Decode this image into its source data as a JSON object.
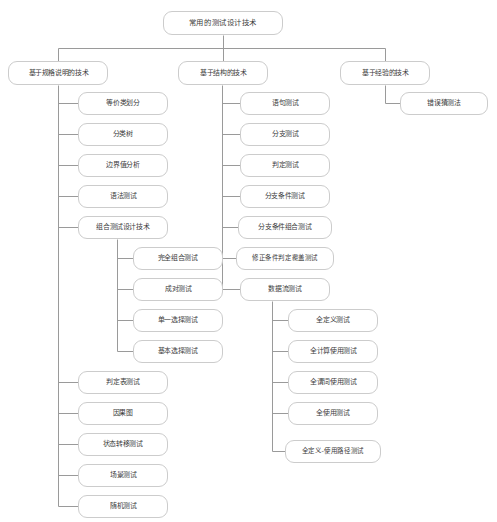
{
  "diagram": {
    "type": "tree-mindmap",
    "title": "常用的测试设计技术",
    "theme": {
      "background": "#ffffff",
      "node_fill": "#ffffff",
      "node_border": "#cccccc",
      "edge_color": "#9a9a9a",
      "text_color": "#3b3b3b"
    }
  },
  "nodes": {
    "root": {
      "label": "常用的测试设计技术",
      "x": 163,
      "y": 11,
      "w": 120,
      "h": 24,
      "fs": 8
    },
    "spec": {
      "label": "基于规格说明的技术",
      "x": 8,
      "y": 61,
      "w": 100,
      "h": 24,
      "fs": 7.5
    },
    "struct": {
      "label": "基于结构的技术",
      "x": 178,
      "y": 61,
      "w": 90,
      "h": 24,
      "fs": 7.5
    },
    "exp": {
      "label": "基于经验的技术",
      "x": 340,
      "y": 61,
      "w": 90,
      "h": 24,
      "fs": 7.5
    },
    "exp1": {
      "label": "错误猜测法",
      "x": 400,
      "y": 92,
      "w": 88,
      "h": 23,
      "fs": 7.5
    },
    "s1": {
      "label": "等价类划分",
      "x": 78,
      "y": 92,
      "w": 90,
      "h": 23,
      "fs": 7.5
    },
    "s2": {
      "label": "分类树",
      "x": 78,
      "y": 123,
      "w": 90,
      "h": 23,
      "fs": 7.5
    },
    "s3": {
      "label": "边界值分析",
      "x": 78,
      "y": 154,
      "w": 90,
      "h": 23,
      "fs": 7.5
    },
    "s4": {
      "label": "语法测试",
      "x": 78,
      "y": 185,
      "w": 90,
      "h": 23,
      "fs": 7.5
    },
    "s5": {
      "label": "组合测试设计技术",
      "x": 78,
      "y": 216,
      "w": 90,
      "h": 23,
      "fs": 7.5
    },
    "c1": {
      "label": "完全组合测试",
      "x": 133,
      "y": 247,
      "w": 90,
      "h": 23,
      "fs": 7.5
    },
    "c2": {
      "label": "成对测试",
      "x": 133,
      "y": 278,
      "w": 90,
      "h": 23,
      "fs": 7.5
    },
    "c3": {
      "label": "单一选择测试",
      "x": 133,
      "y": 309,
      "w": 90,
      "h": 23,
      "fs": 7.5
    },
    "c4": {
      "label": "基本选择测试",
      "x": 133,
      "y": 340,
      "w": 90,
      "h": 23,
      "fs": 7.5
    },
    "s6": {
      "label": "判定表测试",
      "x": 78,
      "y": 371,
      "w": 90,
      "h": 23,
      "fs": 7.5
    },
    "s7": {
      "label": "因果图",
      "x": 78,
      "y": 402,
      "w": 90,
      "h": 23,
      "fs": 7.5
    },
    "s8": {
      "label": "状态转移测试",
      "x": 78,
      "y": 433,
      "w": 90,
      "h": 23,
      "fs": 7.5
    },
    "s9": {
      "label": "场景测试",
      "x": 78,
      "y": 464,
      "w": 90,
      "h": 23,
      "fs": 7.5
    },
    "s10": {
      "label": "随机测试",
      "x": 78,
      "y": 495,
      "w": 90,
      "h": 23,
      "fs": 7.5
    },
    "t1": {
      "label": "语句测试",
      "x": 240,
      "y": 92,
      "w": 90,
      "h": 23,
      "fs": 7.5
    },
    "t2": {
      "label": "分支测试",
      "x": 240,
      "y": 123,
      "w": 90,
      "h": 23,
      "fs": 7.5
    },
    "t3": {
      "label": "判定测试",
      "x": 240,
      "y": 154,
      "w": 90,
      "h": 23,
      "fs": 7.5
    },
    "t4": {
      "label": "分支条件测试",
      "x": 240,
      "y": 185,
      "w": 90,
      "h": 23,
      "fs": 7.5
    },
    "t5": {
      "label": "分支条件组合测试",
      "x": 238,
      "y": 216,
      "w": 94,
      "h": 23,
      "fs": 7.5
    },
    "t6": {
      "label": "修正条件判定覆盖测试",
      "x": 236,
      "y": 247,
      "w": 98,
      "h": 23,
      "fs": 7
    },
    "t7": {
      "label": "数据流测试",
      "x": 240,
      "y": 278,
      "w": 90,
      "h": 23,
      "fs": 7.5
    },
    "d1": {
      "label": "全定义测试",
      "x": 288,
      "y": 309,
      "w": 90,
      "h": 23,
      "fs": 7.5
    },
    "d2": {
      "label": "全计算使用测试",
      "x": 288,
      "y": 340,
      "w": 90,
      "h": 23,
      "fs": 7.5
    },
    "d3": {
      "label": "全谓词使用测试",
      "x": 288,
      "y": 371,
      "w": 90,
      "h": 23,
      "fs": 7.5
    },
    "d4": {
      "label": "全使用测试",
      "x": 288,
      "y": 402,
      "w": 90,
      "h": 23,
      "fs": 7.5
    },
    "d5": {
      "label": "全定义-使用路径测试",
      "x": 285,
      "y": 440,
      "w": 96,
      "h": 23,
      "fs": 7
    }
  },
  "edges": {
    "color": "#9a9a9a",
    "width": 1,
    "root_bus": {
      "from_x": 223,
      "from_y": 35,
      "bus_y": 48,
      "left_x": 58,
      "mid_x": 223,
      "right_x": 385,
      "down_to_y": 61
    },
    "spines": [
      {
        "name": "spec-spine",
        "x": 58,
        "top_y": 85,
        "bottom_y": 506,
        "stubs_to_x": 78,
        "children_y": [
          103,
          134,
          165,
          196,
          227,
          382,
          413,
          444,
          475,
          506
        ]
      },
      {
        "name": "combo-spine",
        "x": 117,
        "top_y": 239,
        "bottom_y": 351,
        "stubs_to_x": 133,
        "children_y": [
          258,
          289,
          320,
          351
        ]
      },
      {
        "name": "struct-spine",
        "x": 222,
        "top_y": 85,
        "bottom_y": 289,
        "stubs_to_x": 240,
        "children_y": [
          103,
          134,
          165,
          196,
          227,
          258,
          289
        ]
      },
      {
        "name": "dataflow-spine",
        "x": 272,
        "top_y": 301,
        "bottom_y": 451,
        "stubs_to_x": 288,
        "children_y": [
          320,
          351,
          382,
          413,
          451
        ]
      },
      {
        "name": "exp-spine",
        "x": 385,
        "top_y": 85,
        "bottom_y": 103,
        "stubs_to_x": 400,
        "children_y": [
          103
        ]
      }
    ]
  }
}
